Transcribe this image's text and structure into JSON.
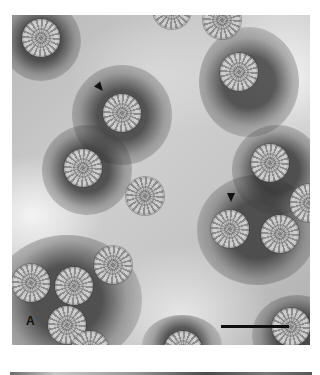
{
  "figure": {
    "panel_label": "A",
    "scale_bar": {
      "x1": 221,
      "x2": 289,
      "y": 326
    },
    "arrowheads": [
      {
        "x": 100,
        "y": 88,
        "direction": "down-right"
      },
      {
        "x": 231,
        "y": 197,
        "direction": "down"
      }
    ],
    "particles": [
      {
        "x": 41,
        "y": 38
      },
      {
        "x": 172,
        "y": 10
      },
      {
        "x": 222,
        "y": 20
      },
      {
        "x": 239,
        "y": 72
      },
      {
        "x": 122,
        "y": 113
      },
      {
        "x": 83,
        "y": 168
      },
      {
        "x": 145,
        "y": 196
      },
      {
        "x": 270,
        "y": 163
      },
      {
        "x": 230,
        "y": 229
      },
      {
        "x": 280,
        "y": 234
      },
      {
        "x": 309,
        "y": 203
      },
      {
        "x": 113,
        "y": 265
      },
      {
        "x": 31,
        "y": 283
      },
      {
        "x": 74,
        "y": 286
      },
      {
        "x": 67,
        "y": 325
      },
      {
        "x": 291,
        "y": 327
      },
      {
        "x": 90,
        "y": 350
      },
      {
        "x": 183,
        "y": 350
      }
    ]
  }
}
